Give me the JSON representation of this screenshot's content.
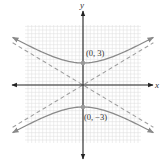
{
  "chart_data": {
    "type": "line",
    "title": "",
    "xlabel": "x",
    "ylabel": "y",
    "equation": "y^2/9 - x^2/25 = 1",
    "grid": true,
    "xlim": [
      -8,
      8
    ],
    "ylim": [
      -8,
      8
    ],
    "series": [
      {
        "name": "upper branch",
        "style": "solid",
        "vertex": [
          0,
          3
        ]
      },
      {
        "name": "lower branch",
        "style": "solid",
        "vertex": [
          0,
          -3
        ]
      },
      {
        "name": "asymptote y = 3/5 x",
        "style": "dashed",
        "slope": 0.6
      },
      {
        "name": "asymptote y = -3/5 x",
        "style": "dashed",
        "slope": -0.6
      }
    ],
    "annotations": [
      {
        "text": "(0, 3)",
        "point": [
          0,
          3
        ]
      },
      {
        "text": "(0, −3)",
        "point": [
          0,
          -3
        ]
      }
    ]
  },
  "labels": {
    "x_axis": "x",
    "y_axis": "y",
    "vertex_top": "(0, 3)",
    "vertex_bottom": "(0, −3)"
  },
  "colors": {
    "curve": "#8a8a8a",
    "asymptote": "#a0a0a0",
    "axis": "#222222",
    "grid": "#dcdcdc",
    "point": "#9a9a9a"
  }
}
